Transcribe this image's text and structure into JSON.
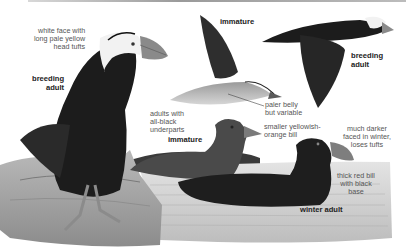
{
  "plate": {
    "subject": "Tufted Puffin field guide illustration",
    "palette": {
      "background": "#ffffff",
      "bird_dark": "#1c1c1c",
      "bird_mid": "#4a4a4a",
      "face_white": "#f2f2f2",
      "bill": "#8a8a8a",
      "rock": "#a8a8a8",
      "water": "#c9c9c9",
      "label_text": "#555555",
      "title_text": "#222222"
    },
    "figures": [
      {
        "id": "perched-breeding-adult",
        "title_lines": [
          "breeding",
          "adult"
        ]
      },
      {
        "id": "flying-immature",
        "title_lines": [
          "immature"
        ]
      },
      {
        "id": "flying-breeding-adult",
        "title_lines": [
          "breeding",
          "adult"
        ]
      },
      {
        "id": "swimming-immature",
        "title_lines": [
          "immature"
        ]
      },
      {
        "id": "swimming-winter-adult",
        "title_lines": [
          "winter adult"
        ]
      }
    ],
    "annotations": [
      {
        "id": "white-face",
        "lines": [
          "white face with",
          "long pale yellow",
          "head tufts"
        ]
      },
      {
        "id": "all-black-underparts",
        "lines": [
          "adults with",
          "all-black",
          "underparts"
        ]
      },
      {
        "id": "paler-belly",
        "lines": [
          "paler belly",
          "but variable"
        ]
      },
      {
        "id": "smaller-bill",
        "lines": [
          "smaller yellowish-",
          "orange bill"
        ]
      },
      {
        "id": "darker-face",
        "lines": [
          "much darker",
          "faced in winter,",
          "loses tufts"
        ]
      },
      {
        "id": "thick-bill",
        "lines": [
          "thick red bill",
          "with black",
          "base"
        ]
      }
    ]
  }
}
